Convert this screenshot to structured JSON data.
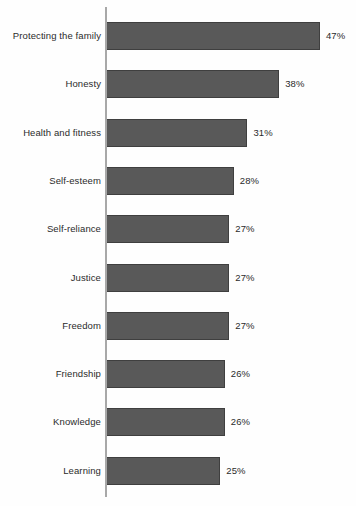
{
  "chart_data": {
    "type": "bar",
    "orientation": "horizontal",
    "title": "",
    "subtitle": "",
    "xlabel": "",
    "ylabel": "",
    "xlim": [
      0,
      50
    ],
    "grid": false,
    "legend": null,
    "value_suffix": "%",
    "categories": [
      "Protecting the family",
      "Honesty",
      "Health and fitness",
      "Self-esteem",
      "Self-reliance",
      "Justice",
      "Freedom",
      "Friendship",
      "Knowledge",
      "Learning"
    ],
    "values": [
      47,
      38,
      31,
      28,
      27,
      27,
      27,
      26,
      26,
      25
    ],
    "data_labels": [
      "47%",
      "38%",
      "31%",
      "28%",
      "27%",
      "27%",
      "27%",
      "26%",
      "26%",
      "25%"
    ],
    "colors": {
      "bar_fill": "#595959",
      "bar_border": "#3f3f3f",
      "axis_line": "#a8a8a8",
      "text": "#2b2b2b",
      "background": "#fefefe"
    }
  }
}
